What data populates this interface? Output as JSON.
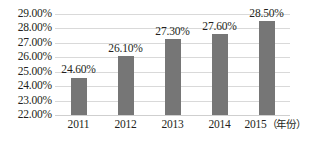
{
  "chart_data": {
    "type": "bar",
    "title": "",
    "subtitle": "",
    "xlabel": "（年份）",
    "ylabel": "",
    "categories": [
      "2011",
      "2012",
      "2013",
      "2014",
      "2015"
    ],
    "values": [
      24.6,
      26.1,
      27.3,
      27.6,
      28.5
    ],
    "data_labels": [
      "24.60%",
      "26.10%",
      "27.30%",
      "27.60%",
      "28.50%"
    ],
    "ylim": [
      22.0,
      29.0
    ],
    "ytick_values": [
      29.0,
      28.0,
      27.0,
      26.0,
      25.0,
      24.0,
      23.0,
      22.0
    ],
    "ytick_labels": [
      "29.00%",
      "28.00%",
      "27.00%",
      "26.00%",
      "25.00%",
      "24.00%",
      "23.00%",
      "22.00%"
    ],
    "grid": true,
    "legend": false,
    "legend_position": "none",
    "series": [
      {
        "name": "",
        "values": [
          24.6,
          26.1,
          27.3,
          27.6,
          28.5
        ]
      }
    ],
    "colors": {
      "bar": "#767676",
      "gridline": "#d9d9d9",
      "axis": "#cfcfcf",
      "text": "#231f20",
      "background": "#ffffff"
    }
  },
  "axis": {
    "x_unit_label": "（年份）"
  }
}
